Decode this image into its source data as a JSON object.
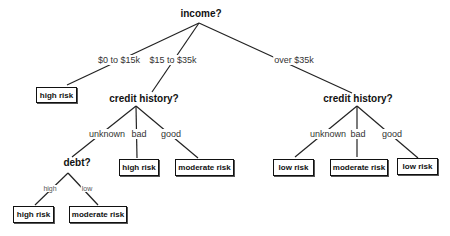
{
  "diagram": {
    "type": "decision-tree",
    "root": {
      "question": "income?",
      "branches": [
        {
          "label": "$0 to $15k",
          "leaf": "high risk"
        },
        {
          "label": "$15 to $35k",
          "node": {
            "question": "credit history?",
            "branches": [
              {
                "label": "unknown",
                "node": {
                  "question": "debt?",
                  "branches": [
                    {
                      "label": "high",
                      "leaf": "high risk"
                    },
                    {
                      "label": "low",
                      "leaf": "moderate risk"
                    }
                  ]
                }
              },
              {
                "label": "bad",
                "leaf": "high risk"
              },
              {
                "label": "good",
                "leaf": "moderate risk"
              }
            ]
          }
        },
        {
          "label": "over $35k",
          "node": {
            "question": "credit history?",
            "branches": [
              {
                "label": "unknown",
                "leaf": "low risk"
              },
              {
                "label": "bad",
                "leaf": "moderate risk"
              },
              {
                "label": "good",
                "leaf": "low risk"
              }
            ]
          }
        }
      ]
    }
  },
  "nodes": {
    "income": "income?",
    "credit_left": "credit history?",
    "credit_right": "credit history?",
    "debt": "debt?"
  },
  "edge_labels": {
    "income_low": "$0 to $15k",
    "income_mid": "$15 to $35k",
    "income_high": "over $35k",
    "cl_unknown": "unknown",
    "cl_bad": "bad",
    "cl_good": "good",
    "cr_unknown": "unknown",
    "cr_bad": "bad",
    "cr_good": "good",
    "debt_high": "high",
    "debt_low": "low"
  },
  "leaves": {
    "income_low": "high risk",
    "cl_bad": "high risk",
    "cl_good": "moderate risk",
    "cr_unknown": "low risk",
    "cr_bad": "moderate risk",
    "cr_good": "low risk",
    "debt_high": "high risk",
    "debt_low": "moderate risk"
  }
}
